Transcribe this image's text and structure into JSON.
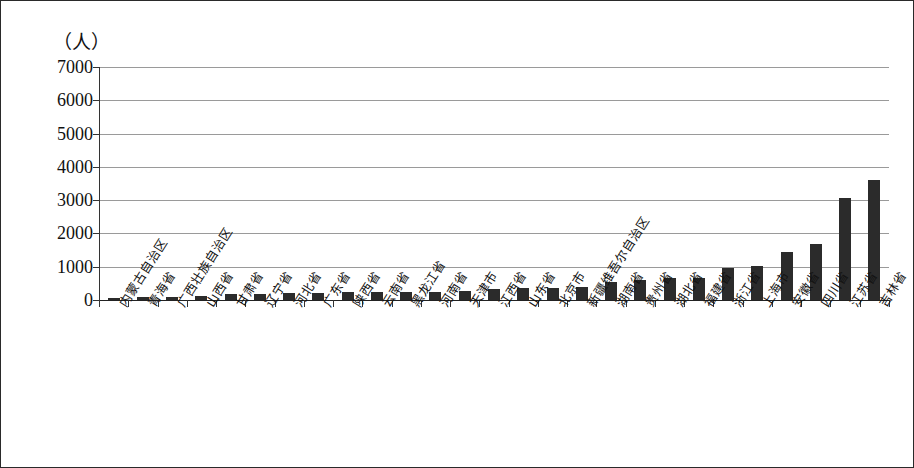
{
  "chart_data": {
    "type": "bar",
    "title": "",
    "subtitle": "",
    "xlabel": "",
    "ylabel": "",
    "unit_label": "（人）",
    "ylim": [
      0,
      7000
    ],
    "ytick_step": 1000,
    "yticks": [
      0,
      1000,
      2000,
      3000,
      4000,
      5000,
      6000,
      7000
    ],
    "ytick_labels": [
      "0",
      "1000",
      "2000",
      "3000",
      "4000",
      "5000",
      "6000",
      "7000"
    ],
    "grid": true,
    "legend": "none",
    "bar_color": "#2b2b2b",
    "sorted": "ascending",
    "categories": [
      "内蒙古自治区",
      "青海省",
      "广西壮族自治区",
      "山西省",
      "甘肃省",
      "辽宁省",
      "河北省",
      "广东省",
      "陕西省",
      "云南省",
      "黑龙江省",
      "河南省",
      "天津市",
      "江西省",
      "山东省",
      "北京市",
      "新疆维吾尔自治区",
      "湖南省",
      "贵州省",
      "湖北省",
      "福建省",
      "浙江省",
      "上海市",
      "安徽省",
      "四川省",
      "江苏省",
      "吉林省"
    ],
    "values": [
      50,
      90,
      95,
      130,
      175,
      190,
      200,
      225,
      235,
      240,
      250,
      255,
      280,
      320,
      350,
      360,
      390,
      530,
      610,
      650,
      655,
      965,
      1020,
      1430,
      1670,
      3050,
      3600
    ]
  }
}
